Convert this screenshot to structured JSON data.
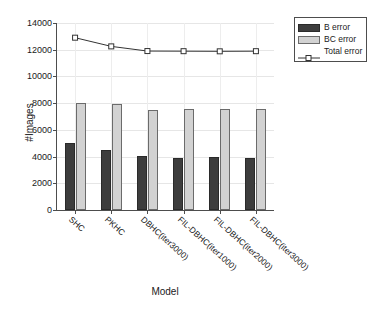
{
  "chart_data": {
    "type": "bar",
    "title": "",
    "xlabel": "Model",
    "ylabel": "#Images",
    "categories": [
      "SHC",
      "PKHC",
      "DBHC(iter3000)",
      "FIL-DBHC(iter1000)",
      "FIL-DBHC(iter2000)",
      "FIL-DBHC(iter3000)"
    ],
    "series": [
      {
        "name": "B error",
        "type": "bar",
        "values": [
          5000,
          4500,
          4050,
          3930,
          3980,
          3920
        ]
      },
      {
        "name": "BC error",
        "type": "bar",
        "values": [
          8000,
          7900,
          7470,
          7560,
          7530,
          7600
        ]
      },
      {
        "name": "Total error",
        "type": "line",
        "values": [
          12900,
          12250,
          11900,
          11890,
          11880,
          11890
        ]
      }
    ],
    "ylim": [
      0,
      14000
    ],
    "yticks": [
      0,
      2000,
      4000,
      6000,
      8000,
      10000,
      12000,
      14000
    ],
    "ytick_labels": [
      "0",
      "2000",
      "4000",
      "6000",
      "8000",
      "10000",
      "12000",
      "14000"
    ],
    "grid": true,
    "legend_position": "upper right",
    "colors": {
      "b_error": "#3d3d3d",
      "bc_error": "#d2d2d2",
      "total_error": "#333333",
      "axis": "#4d4d4d",
      "grid": "#e6e6e6",
      "background": "#ffffff"
    }
  },
  "legend": {
    "entries": [
      {
        "label": "B error",
        "marker": "filled-dark-square"
      },
      {
        "label": "BC error",
        "marker": "filled-light-square"
      },
      {
        "label": "Total error",
        "marker": "line-with-open-square"
      }
    ]
  }
}
